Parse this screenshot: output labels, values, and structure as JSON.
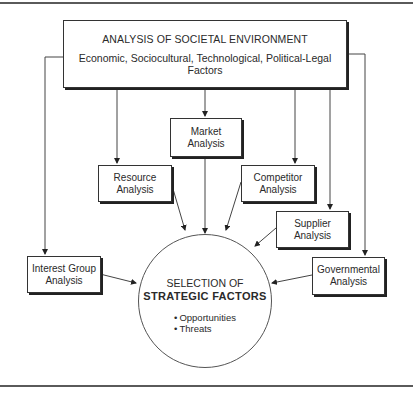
{
  "diagram": {
    "environment": {
      "title": "ANALYSIS OF SOCIETAL ENVIRONMENT",
      "subtitle": "Economic, Sociocultural, Technological, Political-Legal Factors"
    },
    "boxes": {
      "market": {
        "line1": "Market",
        "line2": "Analysis"
      },
      "resource": {
        "line1": "Resource",
        "line2": "Analysis"
      },
      "competitor": {
        "line1": "Competitor",
        "line2": "Analysis"
      },
      "supplier": {
        "line1": "Supplier",
        "line2": "Analysis"
      },
      "interest_group": {
        "line1": "Interest Group",
        "line2": "Analysis"
      },
      "governmental": {
        "line1": "Governmental",
        "line2": "Analysis"
      }
    },
    "center": {
      "line1": "SELECTION OF",
      "line2": "STRATEGIC FACTORS",
      "bullets": [
        "Opportunities",
        "Threats"
      ]
    },
    "colors": {
      "line": "#333333",
      "rule": "#5a5a5a",
      "background": "#ffffff"
    }
  }
}
